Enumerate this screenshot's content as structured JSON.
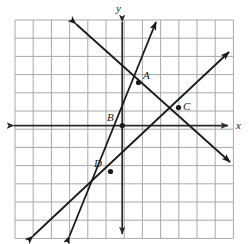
{
  "figure": {
    "type": "coordinate-plane-diagram",
    "background_color": "#ffffff",
    "grid_color": "#a8a8a8",
    "axis_color": "#2b2b2b",
    "line_color": "#1a1a1a",
    "grid": {
      "left": 15,
      "top": 20,
      "spacing": 18.2,
      "columns": 12,
      "rows": 12,
      "show": true
    },
    "axes": {
      "origin_x": 122.2,
      "origin_y": 125.6,
      "x_label": "x",
      "y_label": "y",
      "x_label_pos": {
        "left": 236,
        "top": 120
      },
      "y_label_pos": {
        "left": 116,
        "top": 3
      },
      "x_arrow_both_ends": true,
      "y_arrow_both_ends": true,
      "x_start": 14,
      "x_end": 228,
      "y_start": 22,
      "y_end": 234
    },
    "lines": [
      {
        "name": "steep-line-through-D-B-A",
        "x1": 69.5,
        "y1": 236,
        "x2": 156,
        "y2": 22,
        "arrow_start": true,
        "arrow_end": true
      },
      {
        "name": "descending-line-through-A-C",
        "x1": 76,
        "y1": 24,
        "x2": 230,
        "y2": 162,
        "arrow_start": true,
        "arrow_end": true
      },
      {
        "name": "shallow-line-through-D-C",
        "x1": 33,
        "y1": 236,
        "x2": 229,
        "y2": 52,
        "arrow_start": true,
        "arrow_end": true
      }
    ],
    "points": [
      {
        "label": "A",
        "x": 138.5,
        "y": 82.5,
        "label_left": 143,
        "label_top": 70
      },
      {
        "label": "B",
        "x": 122.2,
        "y": 125.6,
        "label_left": 107,
        "label_top": 112
      },
      {
        "label": "C",
        "x": 178.5,
        "y": 107.5,
        "label_left": 183,
        "label_top": 101
      },
      {
        "label": "D",
        "x": 110.5,
        "y": 171.5,
        "label_left": 94,
        "label_top": 158
      }
    ]
  }
}
